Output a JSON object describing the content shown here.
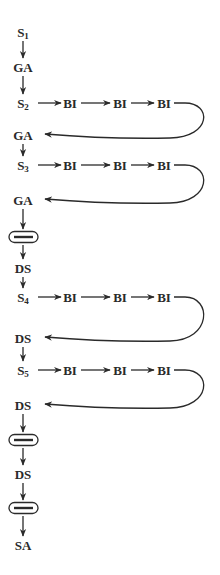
{
  "diagram": {
    "colors": {
      "ink": "#2a2a2a",
      "background": "#ffffff"
    },
    "main_sequence": [
      {
        "id": "n1",
        "type": "state",
        "label": "S",
        "subscript": "1"
      },
      {
        "id": "n2",
        "type": "node",
        "label": "GA"
      },
      {
        "id": "n3",
        "type": "state",
        "label": "S",
        "subscript": "2",
        "branch": [
          "BI",
          "BI",
          "BI"
        ],
        "loop_to": "n4"
      },
      {
        "id": "n4",
        "type": "node",
        "label": "GA"
      },
      {
        "id": "n5",
        "type": "state",
        "label": "S",
        "subscript": "3",
        "branch": [
          "BI",
          "BI",
          "BI"
        ],
        "loop_to": "n6"
      },
      {
        "id": "n6",
        "type": "node",
        "label": "GA"
      },
      {
        "id": "n7",
        "type": "capsule",
        "label": ""
      },
      {
        "id": "n8",
        "type": "node",
        "label": "DS"
      },
      {
        "id": "n9",
        "type": "state",
        "label": "S",
        "subscript": "4",
        "branch": [
          "BI",
          "BI",
          "BI"
        ],
        "loop_to": "n10"
      },
      {
        "id": "n10",
        "type": "node",
        "label": "DS"
      },
      {
        "id": "n11",
        "type": "state",
        "label": "S",
        "subscript": "5",
        "branch": [
          "BI",
          "BI",
          "BI"
        ],
        "loop_to": "n12"
      },
      {
        "id": "n12",
        "type": "node",
        "label": "DS"
      },
      {
        "id": "n13",
        "type": "capsule",
        "label": ""
      },
      {
        "id": "n14",
        "type": "node",
        "label": "DS"
      },
      {
        "id": "n15",
        "type": "capsule",
        "label": ""
      },
      {
        "id": "n16",
        "type": "node",
        "label": "SA"
      }
    ]
  }
}
